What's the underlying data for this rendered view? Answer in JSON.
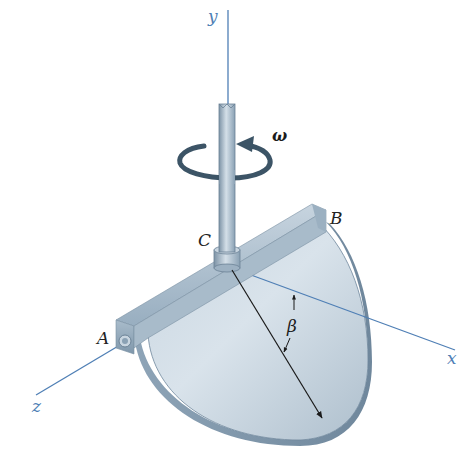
{
  "figure": {
    "type": "dynamics-diagram"
  },
  "axes": {
    "x": {
      "label": "x"
    },
    "y": {
      "label": "y"
    },
    "z": {
      "label": "z"
    }
  },
  "points": {
    "A": {
      "label": "A"
    },
    "B": {
      "label": "B"
    },
    "C": {
      "label": "C"
    }
  },
  "annotations": {
    "angular_velocity": {
      "label": "ω"
    },
    "angle": {
      "label": "β"
    }
  },
  "colors": {
    "axis": "#4f7fb5",
    "plate_light": "#d8e2ea",
    "plate_mid": "#b8c8d6",
    "plate_dark": "#7f97ad",
    "shaft": "#9fb3c4",
    "rotation_arrow": "#3c5466",
    "dimension_line": "#1a1a1a"
  }
}
